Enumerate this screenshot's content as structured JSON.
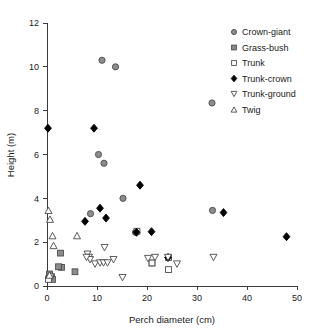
{
  "chart_data": {
    "type": "scatter",
    "title": "",
    "xlabel": "Perch diameter (cm)",
    "ylabel": "Height (m)",
    "xlim": [
      0,
      50
    ],
    "ylim": [
      0,
      12
    ],
    "xticks": [
      0,
      10,
      20,
      30,
      40,
      50
    ],
    "yticks": [
      0,
      2,
      4,
      6,
      8,
      10,
      12
    ],
    "xtick_labels": [
      "0",
      "10",
      "20",
      "30",
      "40",
      "50"
    ],
    "ytick_labels": [
      "0",
      "2",
      "4",
      "6",
      "8",
      "10",
      "12"
    ],
    "grid": false,
    "legend_position": "upper-right",
    "series": [
      {
        "name": "Crown-giant",
        "marker": "circle-grey",
        "points": [
          [
            11.0,
            10.3
          ],
          [
            13.7,
            10.0
          ],
          [
            10.3,
            6.0
          ],
          [
            11.4,
            5.6
          ],
          [
            15.2,
            4.0
          ],
          [
            8.7,
            3.3
          ],
          [
            33.0,
            8.35
          ],
          [
            33.1,
            3.45
          ],
          [
            17.7,
            2.45
          ]
        ]
      },
      {
        "name": "Grass-bush",
        "marker": "square-grey",
        "points": [
          [
            2.7,
            1.5
          ],
          [
            2.9,
            0.85
          ],
          [
            2.3,
            0.88
          ],
          [
            5.6,
            0.65
          ],
          [
            0.5,
            0.55
          ],
          [
            0.9,
            0.42
          ],
          [
            0.4,
            0.35
          ],
          [
            1.1,
            0.3
          ],
          [
            21.0,
            1.05
          ]
        ]
      },
      {
        "name": "Trunk",
        "marker": "square-open",
        "points": [
          [
            18.0,
            2.5
          ],
          [
            21.0,
            1.05
          ],
          [
            24.3,
            1.3
          ],
          [
            24.3,
            0.75
          ],
          [
            0.6,
            0.45
          ],
          [
            0.3,
            0.3
          ]
        ]
      },
      {
        "name": "Trunk-crown",
        "marker": "diamond-filled",
        "points": [
          [
            0.2,
            7.2
          ],
          [
            9.4,
            7.2
          ],
          [
            18.6,
            4.6
          ],
          [
            10.6,
            3.55
          ],
          [
            11.8,
            3.1
          ],
          [
            7.6,
            2.95
          ],
          [
            17.9,
            2.45
          ],
          [
            20.9,
            2.48
          ],
          [
            35.3,
            3.35
          ],
          [
            47.9,
            2.25
          ],
          [
            24.2,
            1.3
          ]
        ]
      },
      {
        "name": "Trunk-ground",
        "marker": "triangle-down-open",
        "points": [
          [
            11.5,
            1.75
          ],
          [
            8.1,
            1.45
          ],
          [
            8.4,
            1.3
          ],
          [
            8.6,
            1.2
          ],
          [
            9.6,
            1.0
          ],
          [
            10.6,
            1.05
          ],
          [
            11.3,
            1.05
          ],
          [
            12.1,
            1.05
          ],
          [
            13.3,
            1.2
          ],
          [
            15.1,
            0.38
          ],
          [
            20.2,
            1.25
          ],
          [
            21.6,
            1.3
          ],
          [
            24.2,
            1.3
          ],
          [
            26.0,
            1.0
          ],
          [
            33.3,
            1.3
          ],
          [
            7.9,
            1.3
          ]
        ]
      },
      {
        "name": "Twig",
        "marker": "triangle-up-open",
        "points": [
          [
            0.3,
            3.45
          ],
          [
            0.6,
            3.05
          ],
          [
            1.1,
            2.3
          ],
          [
            1.3,
            1.85
          ],
          [
            6.0,
            2.3
          ],
          [
            0.5,
            0.5
          ]
        ]
      }
    ]
  },
  "legend": {
    "entries": [
      {
        "label": "Crown-giant",
        "marker": "circle-grey"
      },
      {
        "label": "Grass-bush",
        "marker": "square-grey"
      },
      {
        "label": "Trunk",
        "marker": "square-open"
      },
      {
        "label": "Trunk-crown",
        "marker": "diamond-filled"
      },
      {
        "label": "Trunk-ground",
        "marker": "triangle-down-open"
      },
      {
        "label": "Twig",
        "marker": "triangle-up-open"
      }
    ]
  },
  "colors": {
    "axis": "#3a3a3a",
    "text": "#1a1a1a",
    "marker_grey_fill": "#8c8c8c",
    "marker_open_fill": "#ffffff",
    "marker_filled": "#000000",
    "marker_stroke": "#4a4a4a",
    "background": "#ffffff"
  }
}
